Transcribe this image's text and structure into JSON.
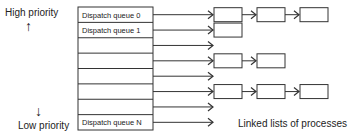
{
  "labels": {
    "high_priority": "High priority",
    "low_priority": "Low priority",
    "linked_lists": "Linked lists of processes"
  },
  "queues": [
    {
      "label": "Dispatch queue 0",
      "processes": 3
    },
    {
      "label": "Dispatch queue 1",
      "processes": 1
    },
    {
      "label": "",
      "processes": 0
    },
    {
      "label": "",
      "processes": 2
    },
    {
      "label": "",
      "processes": 0
    },
    {
      "label": "",
      "processes": 3
    },
    {
      "label": "",
      "processes": 0
    },
    {
      "label": "Dispatch queue N",
      "processes": 0
    }
  ],
  "icons": {
    "up_arrow": "↑",
    "down_arrow": "↓"
  }
}
